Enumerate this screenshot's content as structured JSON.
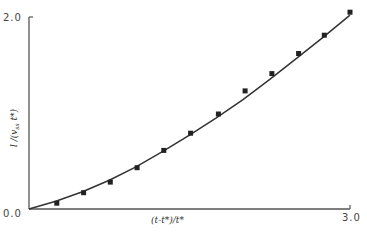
{
  "chart_data": {
    "type": "scatter",
    "title": "",
    "xlabel": "(t-t*)/t*",
    "ylabel": "l /(v_ss t*)",
    "xlim": [
      0.0,
      3.0
    ],
    "ylim": [
      0.0,
      2.0
    ],
    "x_ticks": [
      "0.0",
      "3.0"
    ],
    "y_ticks": [
      "0.0",
      "2.0"
    ],
    "grid": false,
    "legend": null,
    "series": [
      {
        "name": "measured",
        "marker": "square",
        "x": [
          0.26,
          0.51,
          0.76,
          1.01,
          1.26,
          1.51,
          1.77,
          2.02,
          2.27,
          2.52,
          2.76,
          3.0
        ],
        "y": [
          0.06,
          0.17,
          0.28,
          0.43,
          0.61,
          0.79,
          0.99,
          1.23,
          1.41,
          1.62,
          1.81,
          2.05
        ]
      },
      {
        "name": "fit curve",
        "style": "line",
        "x": [
          0.0,
          0.25,
          0.5,
          0.75,
          1.0,
          1.25,
          1.5,
          1.75,
          2.0,
          2.25,
          2.5,
          2.75,
          3.0
        ],
        "y": [
          0.0,
          0.08,
          0.18,
          0.3,
          0.44,
          0.6,
          0.77,
          0.95,
          1.14,
          1.35,
          1.57,
          1.79,
          2.02
        ]
      }
    ]
  },
  "axes": {
    "x_min_label": "0.0",
    "x_max_label": "3.0",
    "y_max_label": "2.0",
    "x_title": "(t-t*)/t*",
    "y_title": "l /(v",
    "y_title_sub": "ss",
    "y_title_tail": " t*)"
  }
}
